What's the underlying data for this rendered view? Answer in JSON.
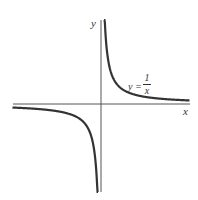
{
  "chart_data": {
    "type": "line",
    "title": "",
    "xlabel": "x",
    "ylabel": "y",
    "annotations": [
      {
        "text": "y = 1/x",
        "position": "upper-right branch"
      }
    ],
    "series": [
      {
        "name": "y = 1/x",
        "function": "1/x",
        "branches": [
          {
            "x": [
              0.1,
              0.2,
              0.5,
              1,
              2,
              3,
              4,
              5,
              6
            ],
            "y": [
              10,
              5,
              2,
              1,
              0.5,
              0.333,
              0.25,
              0.2,
              0.167
            ]
          },
          {
            "x": [
              -6,
              -5,
              -4,
              -3,
              -2,
              -1,
              -0.5,
              -0.2,
              -0.1
            ],
            "y": [
              -0.167,
              -0.2,
              -0.25,
              -0.333,
              -0.5,
              -1,
              -2,
              -5,
              -10
            ]
          }
        ]
      }
    ],
    "xlim": [
      -6,
      6
    ],
    "ylim": [
      -6,
      6
    ],
    "grid": false,
    "legend": "none",
    "colors": {
      "curve": "#333333",
      "axes": "#555555"
    }
  },
  "labels": {
    "x_axis": "x",
    "y_axis": "y",
    "eq_lhs": "y =",
    "eq_num": "1",
    "eq_den": "x"
  }
}
